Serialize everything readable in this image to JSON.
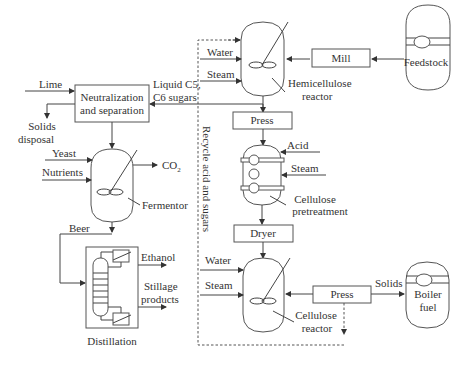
{
  "units": {
    "feedstock": "Feedstock",
    "mill": "Mill",
    "hemicellulose_reactor": [
      "Hemicellulose",
      "reactor"
    ],
    "press_1": "Press",
    "cellulose_pretreatment": [
      "Cellulose",
      "pretreatment"
    ],
    "dryer": "Dryer",
    "cellulose_reactor": [
      "Cellulose",
      "reactor"
    ],
    "press_2": "Press",
    "boiler_fuel": [
      "Boiler",
      "fuel"
    ],
    "neutralization": [
      "Neutralization",
      "and separation"
    ],
    "fermentor": "Fermentor",
    "distillation": "Distillation"
  },
  "streams": {
    "lime": "Lime",
    "solids_disposal": [
      "Solids",
      "disposal"
    ],
    "liquid_sugars": [
      "Liquid C5,",
      "C6 sugars"
    ],
    "yeast": "Yeast",
    "nutrients": "Nutrients",
    "co2": "CO2",
    "beer": "Beer",
    "ethanol": "Ethanol",
    "stillage": [
      "Stillage",
      "products"
    ],
    "water_1": "Water",
    "steam_1": "Steam",
    "acid": "Acid",
    "steam_2": "Steam",
    "water_2": "Water",
    "steam_3": "Steam",
    "solids": "Solids",
    "recycle": "Recycle acid and sugars"
  },
  "colors": {
    "line": "#444444",
    "text": "#333333",
    "background": "#ffffff"
  }
}
